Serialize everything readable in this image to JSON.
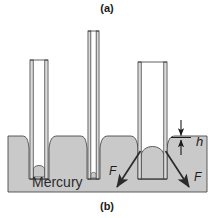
{
  "figure": {
    "caption_top": "(a)",
    "caption_bottom": "(b)",
    "liquid_label": "Mercury",
    "height_label": "h",
    "force_label_left": "F",
    "force_label_right": "F",
    "colors": {
      "liquid_fill": "#c9c9c9",
      "liquid_fill_dark": "#b4b4b4",
      "tube_fill": "#ffffff",
      "tube_stroke": "#3a3a3a",
      "outline": "#2b2b2b",
      "background": "#ffffff",
      "text": "#1a1a1a"
    }
  },
  "diagram_data": {
    "type": "physics-illustration",
    "subject": "Capillary depression of mercury in glass tubes of differing bore",
    "reservoir": {
      "x": 8,
      "y": 136,
      "width": 199,
      "height": 56,
      "surface_y": 136
    },
    "tubes": [
      {
        "id": "tube-narrow",
        "label": "narrow-bore-tube",
        "outer_left": 30,
        "outer_right": 48,
        "top": 60,
        "bottom": 179,
        "wall_thickness": 3,
        "meniscus_top_y": 166,
        "depression_depth": 30,
        "outside_dip_depth": 12
      },
      {
        "id": "tube-medium",
        "label": "very-narrow-bore-tube",
        "outer_left": 88,
        "outer_right": 99,
        "top": 31,
        "bottom": 179,
        "wall_thickness": 3,
        "meniscus_top_y": 174,
        "depression_depth": 38,
        "outside_dip_depth": 12
      },
      {
        "id": "tube-wide",
        "label": "wide-bore-tube",
        "outer_left": 138,
        "outer_right": 167,
        "top": 62,
        "bottom": 179,
        "wall_thickness": 3,
        "meniscus_top_y": 148,
        "depression_depth": 12,
        "outside_dip_depth": 10
      }
    ],
    "annotations": [
      {
        "name": "height-dimension-h",
        "text": "h",
        "text_x": 199,
        "text_y": 144,
        "arrow_top_y": 123,
        "arrow_bottom_y": 152,
        "arrow_x": 181,
        "tick_y": 137,
        "tick_x1": 172,
        "tick_x2": 190
      },
      {
        "name": "force-arrow-left",
        "text": "F",
        "text_x": 114,
        "text_y": 172,
        "tail_x": 141,
        "tail_y": 152,
        "head_x": 116,
        "head_y": 188
      },
      {
        "name": "force-arrow-right",
        "text": "F",
        "text_x": 193,
        "text_y": 178,
        "tail_x": 166,
        "tail_y": 152,
        "head_x": 188,
        "head_y": 188
      },
      {
        "name": "liquid-label",
        "text": "Mercury",
        "text_x": 62,
        "text_y": 183
      }
    ]
  }
}
